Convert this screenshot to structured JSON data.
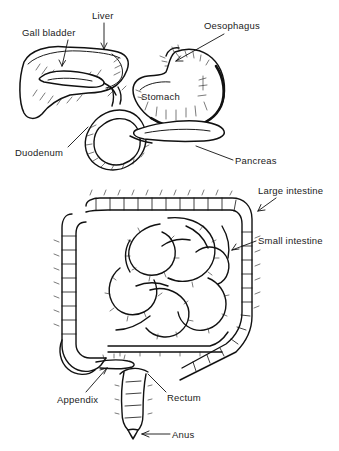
{
  "figure": {
    "style": "line-drawing",
    "background_color": "#ffffff",
    "ink_color": "#111111",
    "width": 339,
    "height": 451
  },
  "labels": [
    {
      "id": "gall-bladder",
      "text": "Gall bladder",
      "x": 22,
      "y": 27,
      "leader": "M 68 40 L 62 66",
      "arrow": "M 62 66 L 59 60 M 62 66 L 65.5 60.5",
      "has_arrow": true
    },
    {
      "id": "liver",
      "text": "Liver",
      "x": 92,
      "y": 10,
      "leader": "M 104 23 L 104 49",
      "arrow": "M 104 49 L 101 43 M 104 49 L 107 43",
      "has_arrow": true
    },
    {
      "id": "oesophagus",
      "text": "Oesophagus",
      "x": 204,
      "y": 20,
      "leader": "M 224 34 L 176 61",
      "arrow": "M 176 61 L 183 61 M 176 61 L 180.5 56",
      "has_arrow": true
    },
    {
      "id": "stomach",
      "text": "Stomach",
      "x": 141,
      "y": 91,
      "leader": "",
      "arrow": "",
      "has_arrow": false
    },
    {
      "id": "duodenum",
      "text": "Duodenum",
      "x": 15,
      "y": 147,
      "leader": "M 68 147 L 88 127",
      "arrow": "",
      "has_arrow": false
    },
    {
      "id": "pancreas",
      "text": "Pancreas",
      "x": 235,
      "y": 155,
      "leader": "M 233 160 L 196 146",
      "arrow": "",
      "has_arrow": false
    },
    {
      "id": "large-intestine",
      "text": "Large intestine",
      "x": 258,
      "y": 185,
      "leader": "M 276 198 L 258 211",
      "arrow": "M 258 211 L 265 210 M 258 211 L 261 204.5",
      "has_arrow": true
    },
    {
      "id": "small-intestine",
      "text": "Small intestine",
      "x": 258,
      "y": 235,
      "leader": "M 256 241 L 232 250",
      "arrow": "M 232 250 L 239 249 M 232 250 L 236 244",
      "has_arrow": true
    },
    {
      "id": "appendix",
      "text": "Appendix",
      "x": 57,
      "y": 394,
      "leader": "M 86 392 L 107 368",
      "arrow": "M 107 368 L 100 370 M 107 368 L 104 374",
      "has_arrow": true
    },
    {
      "id": "rectum",
      "text": "Rectum",
      "x": 167,
      "y": 392,
      "leader": "M 166 392 L 148 374",
      "arrow": "",
      "has_arrow": false
    },
    {
      "id": "anus",
      "text": "Anus",
      "x": 172,
      "y": 429,
      "leader": "M 170 434 L 142 434",
      "arrow": "M 142 434 L 149 431 M 142 434 L 149 437",
      "has_arrow": true
    }
  ],
  "organs": [
    {
      "id": "liver",
      "name": "Liver",
      "region": "upper-left"
    },
    {
      "id": "gall-bladder",
      "name": "Gall bladder",
      "region": "within-liver"
    },
    {
      "id": "oesophagus",
      "name": "Oesophagus",
      "region": "upper-center"
    },
    {
      "id": "stomach",
      "name": "Stomach",
      "region": "upper-right"
    },
    {
      "id": "duodenum",
      "name": "Duodenum",
      "region": "mid-left"
    },
    {
      "id": "pancreas",
      "name": "Pancreas",
      "region": "mid-center"
    },
    {
      "id": "large-intestine",
      "name": "Large intestine",
      "region": "outer-frame"
    },
    {
      "id": "small-intestine",
      "name": "Small intestine",
      "region": "coiled-center"
    },
    {
      "id": "appendix",
      "name": "Appendix",
      "region": "lower-left"
    },
    {
      "id": "rectum",
      "name": "Rectum",
      "region": "lower-center"
    },
    {
      "id": "anus",
      "name": "Anus",
      "region": "bottom"
    }
  ]
}
